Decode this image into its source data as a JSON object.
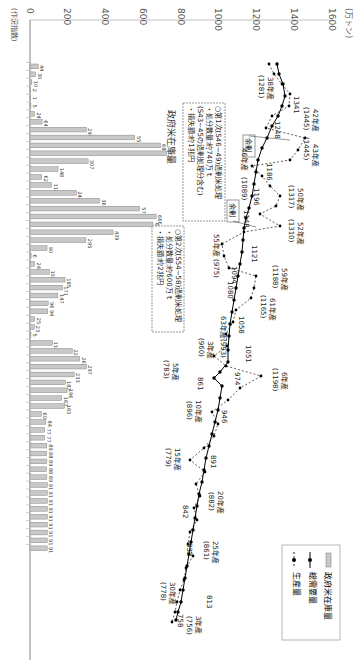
{
  "chart_data": {
    "type": "bar+line",
    "orientation": "rotated-90-clockwise",
    "ylabel": "(万トン)",
    "xlabel": "(年)",
    "x_axis_note": "(作況指数)",
    "ylim": [
      0,
      1600
    ],
    "yticks": [
      0,
      200,
      400,
      600,
      800,
      1000,
      1200,
      1400,
      1600
    ],
    "legend": [
      {
        "name": "政府米在庫量",
        "style": "bar",
        "color": "#bbbbbb"
      },
      {
        "name": "総需要量",
        "style": "solid-line-dot",
        "color": "#000000"
      },
      {
        "name": "生産量",
        "style": "dashed-line-dot",
        "color": "#000000"
      }
    ],
    "series": [
      {
        "name": "政府米在庫量",
        "type": "bar",
        "values": [
          44,
          30,
          10,
          2,
          1,
          5,
          24,
          64,
          298,
          553,
          689,
          720,
          307,
          148,
          62,
          114,
          244,
          367,
          579,
          666,
          649,
          439,
          295,
          90,
          6,
          24,
          102,
          185,
          171,
          147,
          96,
          94,
          25,
          23,
          5,
          118,
          224,
          262,
          297,
          233,
          187,
          196,
          167,
          183,
          60,
          84,
          77,
          77,
          89,
          88,
          89,
          88,
          89,
          91,
          91,
          91,
          91,
          91,
          91,
          91,
          91,
          91
        ]
      },
      {
        "name": "総需要量",
        "type": "line-solid",
        "labels": [
          {
            "value": 1341,
            "note": ""
          },
          {
            "value": 1248,
            "note": ""
          },
          {
            "value": 1186,
            "note": ""
          },
          {
            "value": 1196,
            "note": ""
          },
          {
            "value": 1148,
            "note": ""
          },
          {
            "value": 1121,
            "note": ""
          },
          {
            "value": 1094,
            "note": ""
          },
          {
            "value": 1080,
            "note": ""
          },
          {
            "value": 1058,
            "note": ""
          },
          {
            "value": 1051,
            "note": ""
          },
          {
            "value": 974,
            "note": ""
          },
          {
            "value": 861,
            "note": ""
          },
          {
            "value": 946,
            "note": ""
          },
          {
            "value": 891,
            "note": ""
          },
          {
            "value": 842,
            "note": ""
          },
          {
            "value": 832,
            "note": ""
          },
          {
            "value": 813,
            "note": ""
          },
          {
            "value": 758,
            "note": ""
          }
        ]
      },
      {
        "name": "生産量",
        "type": "line-dashed",
        "labels": [
          {
            "year": "38年産",
            "value": 1281
          },
          {
            "year": "42年産",
            "value": 1445
          },
          {
            "year": "43年産",
            "value": 1445
          },
          {
            "year": "46年産",
            "value": 1089
          },
          {
            "year": "50年産",
            "value": 1317
          },
          {
            "year": "52年産",
            "value": 1310
          },
          {
            "year": "55年産",
            "value": 975
          },
          {
            "year": "59年産",
            "value": 1188
          },
          {
            "year": "61年産",
            "value": 1165
          },
          {
            "year": "63年産",
            "value": 993
          },
          {
            "year": "3年産",
            "value": 960
          },
          {
            "year": "5年産",
            "value": 783
          },
          {
            "year": "6年産",
            "value": 1198
          },
          {
            "year": "10年産",
            "value": 896
          },
          {
            "year": "15年産",
            "value": 779
          },
          {
            "year": "20年産",
            "value": 882
          },
          {
            "year": "25年産",
            "value": 861
          },
          {
            "year": "30年産",
            "value": 778
          },
          {
            "year": "3年産",
            "value": 756
          }
        ]
      }
    ],
    "annotations": [
      {
        "lines": [
          "○第1次(S46~49)過剰米処理",
          "・処分数量:約740万ｔ",
          "(S43~45の過剰処理分含む)",
          "・損失額:約1兆円"
        ]
      },
      {
        "lines": [
          "○第2次(S54~58)過剰米処理",
          "・処分数量:約600万ｔ",
          "・損失額:約2兆円"
        ]
      },
      {
        "label": "余剰"
      },
      {
        "label": "余剰"
      }
    ]
  },
  "axis": {
    "unit": "(万トン)",
    "year_unit": "(年)",
    "zero": "0",
    "note": "(作況指数)",
    "ticks": [
      "200",
      "400",
      "600",
      "800",
      "1000",
      "1200",
      "1400",
      "1600"
    ]
  },
  "legend": {
    "stock": "政府米在庫量",
    "demand": "総需要量",
    "production": "生産量"
  },
  "inline_label": "政府米在庫量",
  "box1": {
    "l1": "○第1次(S46~49)過剰米処理",
    "l2": "・処分数量:約740万ｔ",
    "l3": "(S43~45の過剰処理分含む)",
    "l4": "・損失額:約1兆円"
  },
  "box2": {
    "l1": "○第2次(S54~58)過剰米処理",
    "l2": "・処分数量:約600万ｔ",
    "l3": "・損失額:約2兆円"
  },
  "surplus1": "余剰",
  "surplus2": "余剰",
  "labels": {
    "d1341": "1341",
    "d1248": "1248",
    "d1186": "1186",
    "d1196": "1196",
    "d1148": "1148",
    "d1121": "1121",
    "d1094": "1094",
    "d1080": "1080",
    "d1058": "1058",
    "d1051": "1051",
    "d974": "974",
    "d861": "861",
    "d946": "946",
    "d891": "891",
    "d842": "842",
    "d832": "832",
    "d813": "813",
    "d758": "758",
    "p38": "38年産",
    "p38v": "(1281)",
    "p42": "42年産",
    "p42v": "(1445)",
    "p43": "43年産",
    "p43v": "(1445)",
    "p46": "46年産",
    "p46v": "(1089)",
    "p50": "50年産",
    "p50v": "(1317)",
    "p52": "52年産",
    "p52v": "(1310)",
    "p55": "55年産",
    "p55v": "(975)",
    "p59": "59年産",
    "p59v": "(1188)",
    "p61": "61年産",
    "p61v": "(1165)",
    "p63": "63年産",
    "p63v": "(993)",
    "h3": "3年産",
    "h3v": "(960)",
    "h5": "5年産",
    "h5v": "(783)",
    "h6": "6年産",
    "h6v": "(1198)",
    "h10": "10年産",
    "h10v": "(896)",
    "h15": "15年産",
    "h15v": "(779)",
    "h20": "20年産",
    "h20v": "(882)",
    "h25": "25年産",
    "h25v": "(861)",
    "h30": "30年産",
    "h30v": "(778)",
    "r3": "3年産",
    "r3v": "(756)"
  }
}
